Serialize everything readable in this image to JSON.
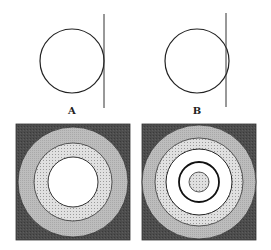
{
  "panels": {
    "A": {
      "label": "A",
      "circle": {
        "cx": 72,
        "cy": 61,
        "r": 32
      },
      "line": {
        "x": 104,
        "y1": 14,
        "y2": 108
      },
      "relation": "tangent"
    },
    "B": {
      "label": "B",
      "circle": {
        "cx": 197,
        "cy": 61,
        "r": 32
      },
      "line": {
        "x": 226,
        "y1": 13,
        "y2": 107
      },
      "relation": "intersecting"
    }
  },
  "targets": {
    "left": {
      "square": {
        "x": 16,
        "y": 124,
        "w": 114,
        "h": 116
      },
      "rings": [
        {
          "r": 55,
          "fill": "light-gray"
        },
        {
          "r": 39,
          "fill": "dotted-light"
        },
        {
          "r": 25,
          "fill": "white"
        }
      ]
    },
    "right": {
      "square": {
        "x": 142,
        "y": 124,
        "w": 114,
        "h": 116
      },
      "rings": [
        {
          "r": 57,
          "fill": "light-gray"
        },
        {
          "r": 44,
          "fill": "dotted-light"
        },
        {
          "r": 33,
          "fill": "white"
        },
        {
          "r": 20,
          "fill": "white",
          "stroke": "bold"
        },
        {
          "r": 10,
          "fill": "dotted-light"
        }
      ]
    }
  },
  "colors": {
    "dark": "#4a4a4a",
    "light_gray": "#b9b9b9",
    "dotted": "#d9d9d9",
    "white": "#ffffff",
    "stroke": "#222222"
  }
}
